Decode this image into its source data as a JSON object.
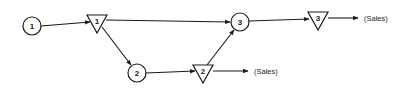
{
  "diagram": {
    "type": "flow-network",
    "colors": {
      "stroke": "#1a1a1a",
      "background": "#ffffff"
    },
    "nodes": [
      {
        "id": "c1",
        "shape": "circle",
        "label": "1",
        "x": 32,
        "y": 26
      },
      {
        "id": "t1",
        "shape": "triangle",
        "label": "1",
        "x": 97,
        "y": 21
      },
      {
        "id": "c2",
        "shape": "circle",
        "label": "2",
        "x": 137,
        "y": 73
      },
      {
        "id": "t2",
        "shape": "triangle",
        "label": "2",
        "x": 203,
        "y": 71
      },
      {
        "id": "c3",
        "shape": "circle",
        "label": "3",
        "x": 240,
        "y": 22
      },
      {
        "id": "t3",
        "shape": "triangle",
        "label": "3",
        "x": 318,
        "y": 18
      }
    ],
    "sinks": [
      {
        "id": "sales2",
        "label": "(Sales)",
        "from": "t2"
      },
      {
        "id": "sales3",
        "label": "(Sales)",
        "from": "t3"
      }
    ],
    "edges": [
      {
        "from": "c1",
        "to": "t1"
      },
      {
        "from": "t1",
        "to": "c3"
      },
      {
        "from": "t1",
        "to": "c2"
      },
      {
        "from": "c2",
        "to": "t2"
      },
      {
        "from": "t2",
        "to": "c3"
      },
      {
        "from": "t2",
        "to": "sales2"
      },
      {
        "from": "c3",
        "to": "t3"
      },
      {
        "from": "t3",
        "to": "sales3"
      }
    ]
  }
}
